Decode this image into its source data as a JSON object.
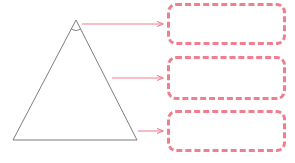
{
  "canvas": {
    "width": 295,
    "height": 163,
    "background": "#ffffff"
  },
  "colors": {
    "shape_stroke": "#7d7d7d",
    "callout_border": "#ef7f8e",
    "callout_border_light": "#f8c3cb",
    "arrow": "#f4aab2",
    "arrow_head": "#ef7f8e",
    "box_fill": "#ffffff"
  },
  "shape": {
    "name": "triangle",
    "label": "",
    "stroke_width": 1,
    "apex": {
      "x": 76,
      "y": 20
    },
    "bottom_left": {
      "x": 13,
      "y": 140
    },
    "bottom_right": {
      "x": 137,
      "y": 140
    },
    "angle_marker": {
      "name": "apex-angle-arc",
      "label": "",
      "radius": 9
    }
  },
  "arrows": [
    {
      "name": "arrow-to-box-1",
      "from": {
        "x": 82,
        "y": 24
      },
      "to": {
        "x": 165,
        "y": 24
      },
      "label": ""
    },
    {
      "name": "arrow-to-box-2",
      "from": {
        "x": 112,
        "y": 78
      },
      "to": {
        "x": 165,
        "y": 78
      },
      "label": ""
    },
    {
      "name": "arrow-to-box-3",
      "from": {
        "x": 138,
        "y": 131
      },
      "to": {
        "x": 165,
        "y": 131
      },
      "label": ""
    }
  ],
  "callout_boxes": [
    {
      "name": "callout-box-1",
      "text": "",
      "placeholder": ""
    },
    {
      "name": "callout-box-2",
      "text": "",
      "placeholder": ""
    },
    {
      "name": "callout-box-3",
      "text": "",
      "placeholder": ""
    }
  ]
}
